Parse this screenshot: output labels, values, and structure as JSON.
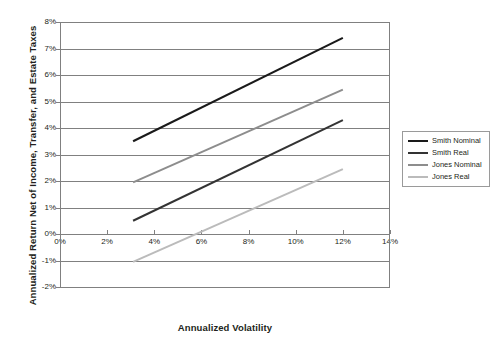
{
  "chart_data": {
    "type": "line",
    "title": "",
    "xlabel": "Annualized Volatility",
    "ylabel": "Annualized Return Net of Income, Transfer, and Estate Taxes",
    "xlim": [
      0,
      14
    ],
    "ylim": [
      -2,
      8
    ],
    "x_tick_labels": [
      "0%",
      "2%",
      "4%",
      "6%",
      "8%",
      "10%",
      "12%",
      "14%"
    ],
    "x_ticks": [
      0,
      2,
      4,
      6,
      8,
      10,
      12,
      14
    ],
    "y_tick_labels": [
      "8%",
      "7%",
      "6%",
      "5%",
      "4%",
      "3%",
      "2%",
      "1%",
      "0%",
      "-1%",
      "-2%"
    ],
    "y_ticks": [
      8,
      7,
      6,
      5,
      4,
      3,
      2,
      1,
      0,
      -1,
      -2
    ],
    "grid": "horizontal",
    "legend_position": "right",
    "x_unit": "%",
    "y_unit": "%",
    "series": [
      {
        "name": "Smith Nominal",
        "color": "#1a1a1a",
        "width": 2.1,
        "x": [
          3.1,
          12.0
        ],
        "values": [
          3.5,
          7.4
        ]
      },
      {
        "name": "Smith Real",
        "color": "#333333",
        "width": 2.0,
        "x": [
          3.1,
          12.0
        ],
        "values": [
          0.5,
          4.3
        ]
      },
      {
        "name": "Jones Nominal",
        "color": "#8d8d8d",
        "width": 2.0,
        "x": [
          3.1,
          12.0
        ],
        "values": [
          1.95,
          5.45
        ]
      },
      {
        "name": "Jones Real",
        "color": "#bbbbbb",
        "width": 2.0,
        "x": [
          3.1,
          12.0
        ],
        "values": [
          -1.05,
          2.45
        ]
      }
    ]
  },
  "legend": {
    "items": [
      {
        "label": "Smith Nominal"
      },
      {
        "label": "Smith Real"
      },
      {
        "label": "Jones Nominal"
      },
      {
        "label": "Jones Real"
      }
    ]
  }
}
